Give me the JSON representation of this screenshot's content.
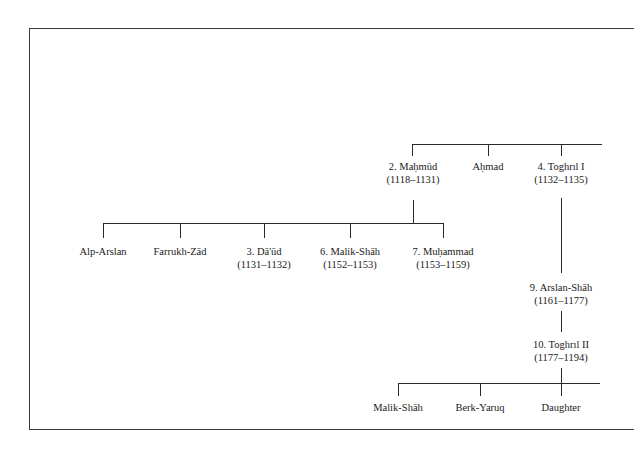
{
  "diagram": {
    "type": "genealogy-tree",
    "nodes": {
      "mahmud": {
        "name": "2. Maḥmūd",
        "dates": "(1118–1131)"
      },
      "ahmad": {
        "name": "Aḥmad"
      },
      "toghril1": {
        "name": "4. Toghrıl I",
        "dates": "(1132–1135)"
      },
      "alp_arslan": {
        "name": "Alp-Arslan"
      },
      "farrukh_zad": {
        "name": "Farrukh-Zād"
      },
      "daud": {
        "name": "3. Dā'ūd",
        "dates": "(1131–1132)"
      },
      "malik_shah6": {
        "name": "6. Malik-Shāh",
        "dates": "(1152–1153)"
      },
      "muhammad7": {
        "name": "7. Muḥammad",
        "dates": "(1153–1159)"
      },
      "arslan_shah9": {
        "name": "9. Arslan-Shāh",
        "dates": "(1161–1177)"
      },
      "toghril2": {
        "name": "10. Toghrıl II",
        "dates": "(1177–1194)"
      },
      "malik_shah": {
        "name": "Malik-Shāh"
      },
      "berk_yaruq": {
        "name": "Berk-Yaruq"
      },
      "daughter": {
        "name": "Daughter"
      }
    },
    "edges": [
      [
        "parent(offscreen)",
        "mahmud"
      ],
      [
        "parent(offscreen)",
        "ahmad"
      ],
      [
        "parent(offscreen)",
        "toghril1"
      ],
      [
        "mahmud",
        "alp_arslan"
      ],
      [
        "mahmud",
        "farrukh_zad"
      ],
      [
        "mahmud",
        "daud"
      ],
      [
        "mahmud",
        "malik_shah6"
      ],
      [
        "mahmud",
        "muhammad7"
      ],
      [
        "toghril1",
        "arslan_shah9"
      ],
      [
        "arslan_shah9",
        "toghril2"
      ],
      [
        "toghril2",
        "malik_shah"
      ],
      [
        "toghril2",
        "berk_yaruq"
      ],
      [
        "toghril2",
        "daughter"
      ]
    ]
  }
}
